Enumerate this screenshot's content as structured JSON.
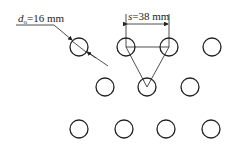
{
  "labels": {
    "diameter_symbol": "d",
    "diameter_sub": "o",
    "diameter_value": "=16 mm",
    "pitch_symbol": "s",
    "pitch_value": "=38 mm"
  },
  "colors": {
    "stroke": "#222222",
    "background": "#ffffff"
  },
  "holes": {
    "radius": 9,
    "rows": [
      {
        "y": 47,
        "x": [
          79,
          126,
          169,
          212
        ]
      },
      {
        "y": 87,
        "x": [
          105,
          147,
          190
        ]
      },
      {
        "y": 129,
        "x": [
          79,
          124,
          166,
          211
        ]
      }
    ]
  }
}
